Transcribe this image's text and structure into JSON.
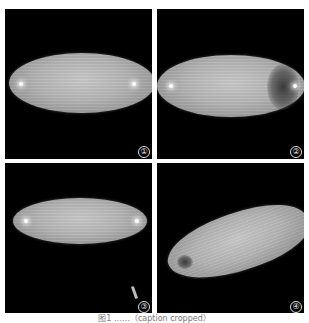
{
  "figure": {
    "panels": [
      {
        "label": "①",
        "description": "egg, lateral view, uniform"
      },
      {
        "label": "②",
        "description": "egg with darkened posterior end"
      },
      {
        "label": "③",
        "description": "smaller egg, lateral view"
      },
      {
        "label": "④",
        "description": "deformed / collapsed egg"
      }
    ],
    "caption": "图1 ……（caption cropped）",
    "colors": {
      "background": "#000000",
      "frame": "#ffffff",
      "egg": "#b4b4b4"
    }
  }
}
